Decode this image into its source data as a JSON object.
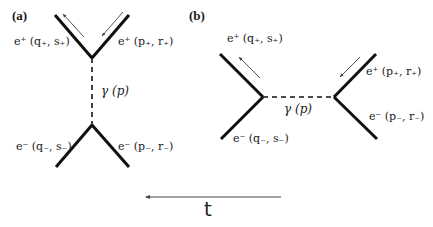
{
  "panels": {
    "a": {
      "label": "(a)",
      "top_left": "e⁺ (q₊, s₊)",
      "top_right": "e⁺ (p₊, r₊)",
      "photon": "γ (p)",
      "bottom_left": "e⁻ (q₋, s₋)",
      "bottom_right": "e⁻ (p₋, r₋)"
    },
    "b": {
      "label": "(b)",
      "top_left": "e⁺ (q₊, s₊)",
      "top_right": "e⁺ (p₊, r₊)",
      "photon": "γ (p)",
      "bottom_left": "e⁻ (q₋, s₋)",
      "bottom_right": "e⁻ (p₋, r₋)"
    }
  },
  "time_axis": {
    "label": "t",
    "direction": "right-to-left"
  },
  "colors": {
    "line": "#111111",
    "momentum_arrow": "#555555",
    "background": "#ffffff"
  }
}
